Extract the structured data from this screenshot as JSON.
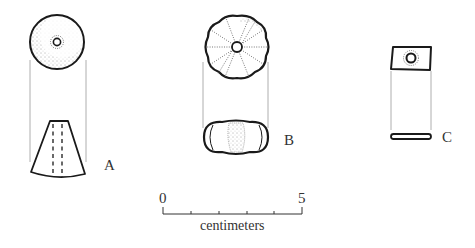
{
  "figure": {
    "artifacts": [
      {
        "id": "A",
        "label": "A",
        "top_view": "circular disc with central perforation, stippled",
        "side_view": "truncated cone with vertical dashed perforation"
      },
      {
        "id": "B",
        "label": "B",
        "top_view": "lobed rosette (melon bead) with central perforation and radial grooves",
        "side_view": "flattened oblate profile with stippled center"
      },
      {
        "id": "C",
        "label": "C",
        "top_view": "square plaque with central perforation",
        "side_view": "thin flat bar"
      }
    ],
    "scale_bar": {
      "start_label": "0",
      "end_label": "5",
      "unit_label": "centimeters",
      "ticks": 6
    }
  },
  "colors": {
    "ink": "#1a1a1a",
    "guide": "#9a9a9a",
    "stipple": "#444444",
    "background": "#ffffff"
  }
}
